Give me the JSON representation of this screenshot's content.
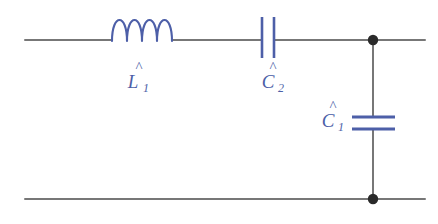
{
  "figure": {
    "kind": "electrical-circuit-schematic",
    "title": "",
    "background_color": "#ffffff",
    "wire_color": "#777777",
    "component_color": "#4d5fa8",
    "node_color": "#2a2a2a"
  },
  "components": [
    {
      "id": "inductor-l1",
      "type": "inductor",
      "label": "L",
      "accent": "̂",
      "subscript": "1",
      "label_full": "L̂1",
      "orientation": "horizontal",
      "coil_turns": 4,
      "branch": "series-top"
    },
    {
      "id": "capacitor-c2",
      "type": "capacitor",
      "label": "C",
      "accent": "̂",
      "subscript": "2",
      "label_full": "Ĉ2",
      "orientation": "horizontal",
      "plates": 2,
      "branch": "series-top"
    },
    {
      "id": "capacitor-c1",
      "type": "capacitor",
      "label": "C",
      "accent": "̂",
      "subscript": "1",
      "label_full": "Ĉ1",
      "orientation": "vertical",
      "plates": 2,
      "branch": "shunt"
    }
  ],
  "nodes": [
    {
      "id": "node-top",
      "label": "",
      "filled": true
    },
    {
      "id": "node-bottom",
      "label": "",
      "filled": true
    }
  ],
  "wires": [
    {
      "id": "top-rail",
      "label": ""
    },
    {
      "id": "bottom-rail",
      "label": ""
    },
    {
      "id": "shunt-branch",
      "label": ""
    }
  ],
  "labels": {
    "l1": "L",
    "l1_sub": "1",
    "c2": "C",
    "c2_sub": "2",
    "c1": "C",
    "c1_sub": "1",
    "hat": "^"
  }
}
